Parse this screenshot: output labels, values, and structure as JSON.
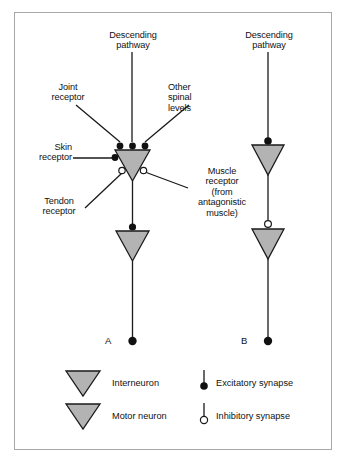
{
  "figure": {
    "background_color": "#ffffff",
    "frame_color": "#a8a8a8",
    "neuron_fill": "#b3b3b3",
    "neuron_stroke": "#1a1a1a",
    "line_color": "#1a1a1a",
    "synapse_fill_excitatory": "#111111",
    "synapse_fill_inhibitory": "#ffffff"
  },
  "panel_a": {
    "id": "A",
    "descending_pathway_label": "Descending\npathway",
    "joint_receptor_label": "Joint\nreceptor",
    "other_spinal_levels_label": "Other\nspinal\nlevels",
    "skin_receptor_label": "Skin\nreceptor",
    "muscle_receptor_label": "Muscle\nreceptor\n(from\nantagonistic\nmuscle)",
    "tendon_receptor_label": "Tendon\nreceptor",
    "inputs": [
      {
        "name": "joint-receptor",
        "type": "excitatory"
      },
      {
        "name": "descending-pathway",
        "type": "excitatory"
      },
      {
        "name": "other-spinal-levels",
        "type": "excitatory"
      },
      {
        "name": "skin-receptor",
        "type": "excitatory"
      },
      {
        "name": "tendon-receptor",
        "type": "inhibitory"
      },
      {
        "name": "muscle-receptor",
        "type": "inhibitory"
      }
    ],
    "interneuron_to_motor_synapse": "excitatory",
    "output_terminal": "excitatory"
  },
  "panel_b": {
    "id": "B",
    "descending_pathway_label": "Descending\npathway",
    "inputs": [
      {
        "name": "descending-pathway",
        "type": "excitatory"
      }
    ],
    "interneuron_to_motor_synapse": "inhibitory",
    "output_terminal": "excitatory"
  },
  "legend": {
    "items": [
      {
        "key": "interneuron",
        "symbol": "triangle",
        "label": "Interneuron"
      },
      {
        "key": "motor-neuron",
        "symbol": "triangle",
        "label": "Motor neuron"
      },
      {
        "key": "excitatory-synapse",
        "symbol": "filled-circle-stalk",
        "label": "Excitatory synapse"
      },
      {
        "key": "inhibitory-synapse",
        "symbol": "open-circle-stalk",
        "label": "Inhibitory synapse"
      }
    ]
  }
}
